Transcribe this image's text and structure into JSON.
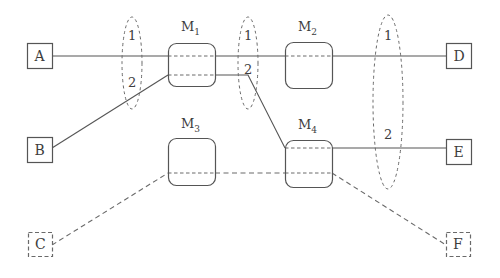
{
  "diagram": {
    "colors": {
      "stroke": "#555555",
      "dashed_stroke": "#6a6a6a",
      "text": "#3d3d3d",
      "background": "#ffffff"
    },
    "terminals": [
      {
        "id": "A",
        "label": "A",
        "style": "solid",
        "x": 27,
        "y": 43,
        "w": 25,
        "h": 25
      },
      {
        "id": "B",
        "label": "B",
        "style": "solid",
        "x": 27,
        "y": 137,
        "w": 25,
        "h": 25
      },
      {
        "id": "C",
        "label": "C",
        "style": "dashed",
        "x": 28,
        "y": 232,
        "w": 24,
        "h": 24
      },
      {
        "id": "D",
        "label": "D",
        "style": "solid",
        "x": 446,
        "y": 43,
        "w": 25,
        "h": 25
      },
      {
        "id": "E",
        "label": "E",
        "style": "solid",
        "x": 446,
        "y": 139,
        "w": 25,
        "h": 25
      },
      {
        "id": "F",
        "label": "F",
        "style": "dashed",
        "x": 446,
        "y": 232,
        "w": 24,
        "h": 24
      }
    ],
    "modules": [
      {
        "id": "M1",
        "label": "M",
        "sub": "1",
        "x": 168,
        "y": 43,
        "w": 47,
        "h": 43,
        "label_x": 181,
        "label_y": 20
      },
      {
        "id": "M2",
        "label": "M",
        "sub": "2",
        "x": 285,
        "y": 42,
        "w": 47,
        "h": 46,
        "label_x": 298,
        "label_y": 20
      },
      {
        "id": "M3",
        "label": "M",
        "sub": "3",
        "x": 168,
        "y": 138,
        "w": 47,
        "h": 47,
        "label_x": 181,
        "label_y": 117
      },
      {
        "id": "M4",
        "label": "M",
        "sub": "4",
        "x": 285,
        "y": 140,
        "w": 47,
        "h": 47,
        "label_x": 298,
        "label_y": 118
      }
    ],
    "ellipses": [
      {
        "id": "cut-1",
        "cx": 132,
        "cy": 63,
        "rx": 10,
        "ry": 46
      },
      {
        "id": "cut-2",
        "cx": 248,
        "cy": 63,
        "rx": 10,
        "ry": 46
      },
      {
        "id": "cut-3",
        "cx": 388,
        "cy": 102,
        "rx": 15,
        "ry": 87
      }
    ],
    "port_labels": [
      {
        "id": "cut1-port1",
        "text": "1",
        "x": 128,
        "y": 29
      },
      {
        "id": "cut1-port2",
        "text": "2",
        "x": 128,
        "y": 76
      },
      {
        "id": "cut2-port1",
        "text": "1",
        "x": 244,
        "y": 29
      },
      {
        "id": "cut2-port2",
        "text": "2",
        "x": 244,
        "y": 63
      },
      {
        "id": "cut3-port1",
        "text": "1",
        "x": 384,
        "y": 29
      },
      {
        "id": "cut3-port2",
        "text": "2",
        "x": 384,
        "y": 128
      }
    ],
    "solid_links": [
      {
        "id": "A-to-M1",
        "points": "52,56 168,56"
      },
      {
        "id": "M1-to-M2",
        "points": "215,56 285,56"
      },
      {
        "id": "M2-to-D",
        "points": "332,56 446,56"
      },
      {
        "id": "B-to-M1",
        "points": "52,148 168,75"
      },
      {
        "id": "M1-to-M4",
        "points": "215,75 248,75 285,148"
      },
      {
        "id": "M4-to-E",
        "points": "332,148 446,148"
      }
    ],
    "dashed_links": [
      {
        "id": "C-to-M3",
        "points": "52,245 168,173"
      },
      {
        "id": "M3-to-M4",
        "points": "215,173 285,173"
      },
      {
        "id": "M4-to-F",
        "points": "332,173 446,245"
      }
    ],
    "internal_dashed": [
      {
        "id": "M1-internal-top",
        "points": "168,56 215,56"
      },
      {
        "id": "M1-internal-bottom",
        "points": "168,75 215,75"
      },
      {
        "id": "M2-internal",
        "points": "285,56 332,56"
      },
      {
        "id": "M3-internal",
        "points": "168,173 215,173"
      },
      {
        "id": "M4-internal-top",
        "points": "285,148 332,148"
      },
      {
        "id": "M4-internal-bottom",
        "points": "285,173 332,173"
      }
    ]
  }
}
